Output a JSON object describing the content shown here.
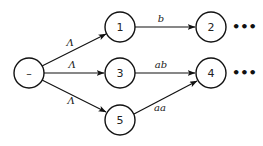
{
  "diagram": {
    "type": "state-transition-graph",
    "colors": {
      "stroke": "#111111",
      "fill": "#ffffff",
      "text": "#222222"
    },
    "nodes": [
      {
        "id": "start",
        "label": "–",
        "cx": 29,
        "cy": 73,
        "r": 15
      },
      {
        "id": "n1",
        "label": "1",
        "cx": 120,
        "cy": 27,
        "r": 15
      },
      {
        "id": "n3",
        "label": "3",
        "cx": 120,
        "cy": 73,
        "r": 15
      },
      {
        "id": "n5",
        "label": "5",
        "cx": 120,
        "cy": 120,
        "r": 15
      },
      {
        "id": "n2",
        "label": "2",
        "cx": 211,
        "cy": 27,
        "r": 15
      },
      {
        "id": "n4",
        "label": "4",
        "cx": 211,
        "cy": 73,
        "r": 15
      }
    ],
    "edges": [
      {
        "from": "start",
        "to": "n1",
        "label": "Λ"
      },
      {
        "from": "start",
        "to": "n3",
        "label": "Λ"
      },
      {
        "from": "start",
        "to": "n5",
        "label": "Λ"
      },
      {
        "from": "n1",
        "to": "n2",
        "label": "b"
      },
      {
        "from": "n3",
        "to": "n4",
        "label": "ab"
      },
      {
        "from": "n5",
        "to": "n4",
        "label": "aa"
      }
    ],
    "continuations": [
      {
        "after": "n2",
        "label": "•••"
      },
      {
        "after": "n4",
        "label": "•••"
      }
    ]
  }
}
